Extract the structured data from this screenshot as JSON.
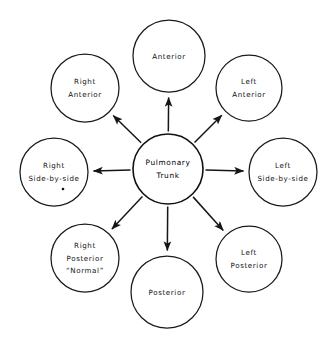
{
  "diagram": {
    "type": "radial-hub-and-spoke",
    "title_text": "",
    "background_color": "#ffffff",
    "stroke_color": "#111111",
    "text_color": "#111111",
    "center": {
      "id": "pulmonary-trunk",
      "lines": [
        "Pulmonary",
        "Trunk"
      ],
      "cx": 168,
      "cy": 169,
      "r": 35
    },
    "nodes": [
      {
        "id": "anterior",
        "position": "top",
        "lines": [
          "Anterior"
        ],
        "cx": 169,
        "cy": 56,
        "r": 36,
        "angle_deg": 270,
        "footnote_marker": false
      },
      {
        "id": "left-anterior",
        "position": "top-right",
        "lines": [
          "Left",
          "Anterior"
        ],
        "cx": 249,
        "cy": 88,
        "r": 33,
        "angle_deg": 315,
        "footnote_marker": false
      },
      {
        "id": "left-side-by-side",
        "position": "right",
        "lines": [
          "Left",
          "Side-by-side"
        ],
        "cx": 283,
        "cy": 172,
        "r": 34,
        "angle_deg": 0,
        "footnote_marker": false
      },
      {
        "id": "left-posterior",
        "position": "bottom-right",
        "lines": [
          "Left",
          "Posterior"
        ],
        "cx": 249,
        "cy": 259,
        "r": 33,
        "angle_deg": 45,
        "footnote_marker": false
      },
      {
        "id": "posterior",
        "position": "bottom",
        "lines": [
          "Posterior"
        ],
        "cx": 167,
        "cy": 292,
        "r": 36,
        "angle_deg": 90,
        "footnote_marker": false
      },
      {
        "id": "right-posterior-normal",
        "position": "bottom-left",
        "lines": [
          "Right",
          "Posterior",
          "“Normal”"
        ],
        "cx": 85,
        "cy": 258,
        "r": 34,
        "angle_deg": 135,
        "footnote_marker": false
      },
      {
        "id": "right-side-by-side",
        "position": "left",
        "lines": [
          "Right",
          "Side-by-side"
        ],
        "cx": 54,
        "cy": 172,
        "r": 34,
        "angle_deg": 180,
        "footnote_marker": true
      },
      {
        "id": "right-anterior",
        "position": "top-left",
        "lines": [
          "Right",
          "Anterior"
        ],
        "cx": 85,
        "cy": 88,
        "r": 34,
        "angle_deg": 225,
        "footnote_marker": false
      }
    ],
    "arrows": [
      {
        "id": "arrow-to-anterior",
        "from": "pulmonary-trunk",
        "to": "anterior"
      },
      {
        "id": "arrow-to-left-anterior",
        "from": "pulmonary-trunk",
        "to": "left-anterior"
      },
      {
        "id": "arrow-to-left-side-by-side",
        "from": "pulmonary-trunk",
        "to": "left-side-by-side"
      },
      {
        "id": "arrow-to-left-posterior",
        "from": "pulmonary-trunk",
        "to": "left-posterior"
      },
      {
        "id": "arrow-to-posterior",
        "from": "pulmonary-trunk",
        "to": "posterior"
      },
      {
        "id": "arrow-to-right-posterior",
        "from": "pulmonary-trunk",
        "to": "right-posterior-normal"
      },
      {
        "id": "arrow-to-right-side-by-side",
        "from": "pulmonary-trunk",
        "to": "right-side-by-side"
      },
      {
        "id": "arrow-to-right-anterior",
        "from": "pulmonary-trunk",
        "to": "right-anterior"
      }
    ]
  }
}
